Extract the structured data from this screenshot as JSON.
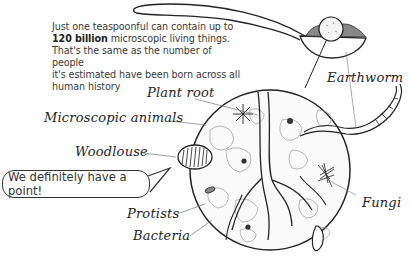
{
  "intro": {
    "line1": "Just one teaspoonful can contain up to",
    "bold": "120 billion",
    "line2_rest": " microscopic living things.",
    "line3": "That's the same as the number of people",
    "line4": "it's estimated have been born across all",
    "line5": "human history"
  },
  "labels": {
    "plant_root": "Plant root",
    "microscopic_animals": "Microscopic animals",
    "woodlouse": "Woodlouse",
    "protists": "Protists",
    "bacteria": "Bacteria",
    "earthworm": "Earthworm",
    "fungi": "Fungi"
  },
  "speech_bubble": {
    "text": "We definitely have a point!"
  },
  "icons": [
    "teaspoon-icon",
    "soil-magnifier-circle",
    "woodlouse-icon",
    "earthworm-icon",
    "fungi-icon",
    "mite-icon"
  ]
}
